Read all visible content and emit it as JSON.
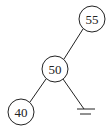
{
  "diagram": {
    "type": "binary-tree",
    "nodes": [
      {
        "id": "n55",
        "label": "55",
        "cx": 92,
        "cy": 19,
        "r": 13
      },
      {
        "id": "n50",
        "label": "50",
        "cx": 55,
        "cy": 69,
        "r": 13
      },
      {
        "id": "n40",
        "label": "40",
        "cx": 21,
        "cy": 112,
        "r": 13
      }
    ],
    "edges": [
      {
        "from": "55",
        "to": "50",
        "side": "left"
      },
      {
        "from": "50",
        "to": "40",
        "side": "left"
      },
      {
        "from": "50",
        "to": "null",
        "side": "right"
      }
    ],
    "null_child": {
      "parent": "50",
      "side": "right",
      "symbol": "ground-null"
    },
    "colors": {
      "stroke": "#222222",
      "background": "#ffffff"
    }
  }
}
